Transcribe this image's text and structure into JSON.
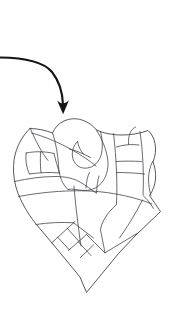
{
  "figure": {
    "title": "Subdivided region outline with pointer annotation",
    "width": 171,
    "height": 309,
    "background_color": "#ffffff",
    "line_color": "#3a3a42",
    "pointer_color": "#141418",
    "outline_stroke_width": 0.85,
    "divider_stroke_width": 0.75,
    "pointer_stroke_width": 2.1
  },
  "annotation": {
    "pointer_name": "curved-down-arrow",
    "description": "Curved arrow entering from left edge and turning downward",
    "start_point": [
      0,
      57
    ],
    "tip_point": [
      63,
      114
    ],
    "direction": "down"
  },
  "diagram_data": {
    "type": "line-art-region-map",
    "bounding_box": [
      13,
      119,
      162,
      293
    ],
    "outline_name": "region-boundary",
    "cell_count": 17,
    "feature_name": "central-hook-notch",
    "regions": [
      "upper-left-band",
      "upper-left-cells",
      "central-rounded-block",
      "central-hook-notch",
      "upper-right-block",
      "right-narrow-cells",
      "right-edge-sliver",
      "mid-horizontal-band",
      "lower-left-panel",
      "lower-parallelogram-strip",
      "lower-right-wedge",
      "bottom-point"
    ]
  }
}
